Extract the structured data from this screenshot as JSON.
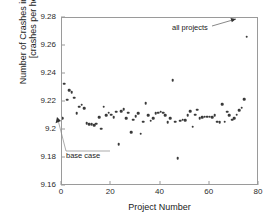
{
  "chart_data": {
    "type": "scatter",
    "title": "",
    "xlabel": "Project Number",
    "ylabel": "Number of Crashes in Sections\n[crashes per hour]",
    "xlim": [
      0,
      80
    ],
    "ylim": [
      9.16,
      9.28
    ],
    "xticks": [
      "0",
      "20",
      "40",
      "60",
      "80"
    ],
    "xtick_values": [
      0,
      20,
      40,
      60,
      80
    ],
    "yticks": [
      "9.16",
      "9.18",
      "9.2",
      "9.22",
      "9.24",
      "9.26",
      "9.28"
    ],
    "ytick_values": [
      9.16,
      9.18,
      9.2,
      9.22,
      9.24,
      9.26,
      9.28
    ],
    "grid": false,
    "legend": null,
    "marker_color": "#3a3a3a",
    "frame_color": "#9a9a9a",
    "annotations": [
      {
        "name": "all-projects",
        "text": "all projects",
        "points_to_x": 75,
        "points_to_y": 9.2665
      },
      {
        "name": "base-case",
        "text": "base case",
        "points_to_x": 0,
        "points_to_y": 9.2055
      }
    ],
    "x": [
      0,
      1,
      2,
      3,
      4,
      5,
      6,
      7,
      8,
      9,
      10,
      11,
      12,
      13,
      14,
      15,
      16,
      17,
      18,
      19,
      20,
      21,
      22,
      23,
      24,
      25,
      26,
      27,
      28,
      29,
      30,
      31,
      32,
      33,
      34,
      35,
      36,
      37,
      38,
      39,
      40,
      41,
      42,
      43,
      44,
      45,
      46,
      47,
      48,
      49,
      50,
      51,
      52,
      53,
      54,
      55,
      56,
      57,
      58,
      59,
      60,
      61,
      62,
      63,
      64,
      65,
      66,
      67,
      68,
      69,
      70,
      71,
      72,
      73,
      74,
      75
    ],
    "y": [
      9.2085,
      9.233,
      9.2215,
      9.2285,
      9.227,
      9.223,
      9.212,
      9.2165,
      9.218,
      9.2155,
      9.205,
      9.204,
      9.204,
      9.2035,
      9.2045,
      9.209,
      9.201,
      9.2165,
      9.2105,
      9.2125,
      9.211,
      9.209,
      9.213,
      9.19,
      9.2135,
      9.215,
      9.2085,
      9.2125,
      9.1985,
      9.2075,
      9.21,
      9.212,
      9.1975,
      9.206,
      9.219,
      9.2105,
      9.2065,
      9.2085,
      9.212,
      9.2125,
      9.213,
      9.2125,
      9.2105,
      9.2055,
      9.2085,
      9.2355,
      9.206,
      9.18,
      9.2065,
      9.2075,
      9.207,
      9.2105,
      9.2135,
      9.2025,
      9.211,
      9.2145,
      9.2085,
      9.209,
      9.2095,
      9.2095,
      9.2095,
      9.209,
      9.2105,
      9.206,
      9.2055,
      9.2185,
      9.206,
      9.213,
      9.2105,
      9.2075,
      9.2085,
      9.211,
      9.214,
      9.216,
      9.222,
      9.2665
    ]
  }
}
